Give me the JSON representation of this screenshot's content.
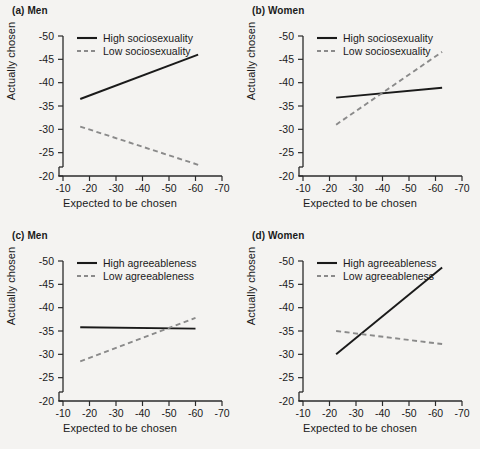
{
  "figure": {
    "background_color": "#f4f3f1",
    "solid_color": "#1a1a1a",
    "dashed_color": "#8a8a8a",
    "axis_color": "#2b2b2b"
  },
  "chart_data": [
    {
      "type": "line",
      "panel_id": "a",
      "title": "(a) Men",
      "xlabel": "Expected to be chosen",
      "ylabel": "Actually chosen",
      "xticks": [
        -10,
        -20,
        -30,
        -40,
        -50,
        -60,
        -70
      ],
      "yticks": [
        -50,
        -45,
        -40,
        -35,
        -30,
        -25,
        -20
      ],
      "xlim": [
        -10,
        -70
      ],
      "ylim": [
        -20,
        -50
      ],
      "x_inverted": true,
      "y_inverted": true,
      "grid": false,
      "legend_position": "top-left-inside",
      "series": [
        {
          "name": "High sociosexuality",
          "style": "solid",
          "x": [
            -16.5,
            -61.0
          ],
          "y": [
            -36.5,
            -46.0
          ]
        },
        {
          "name": "Low sociosexuality",
          "style": "dashed",
          "x": [
            -16.5,
            -61.0
          ],
          "y": [
            -30.6,
            -22.4
          ]
        }
      ]
    },
    {
      "type": "line",
      "panel_id": "b",
      "title": "(b) Women",
      "xlabel": "Expected to be chosen",
      "ylabel": "Actually chosen",
      "xticks": [
        -10,
        -20,
        -30,
        -40,
        -50,
        -60,
        -70
      ],
      "yticks": [
        -50,
        -45,
        -40,
        -35,
        -30,
        -25,
        -20
      ],
      "xlim": [
        -10,
        -70
      ],
      "ylim": [
        -20,
        -50
      ],
      "x_inverted": true,
      "y_inverted": true,
      "grid": false,
      "legend_position": "top-left-inside",
      "series": [
        {
          "name": "High sociosexuality",
          "style": "solid",
          "x": [
            -22.5,
            -62.5
          ],
          "y": [
            -36.8,
            -38.9
          ]
        },
        {
          "name": "Low sociosexuality",
          "style": "dashed",
          "x": [
            -22.5,
            -62.5
          ],
          "y": [
            -31.0,
            -46.6
          ]
        }
      ]
    },
    {
      "type": "line",
      "panel_id": "c",
      "title": "(c) Men",
      "xlabel": "Expected to be chosen",
      "ylabel": "Actually chosen",
      "xticks": [
        -10,
        -20,
        -30,
        -40,
        -50,
        -60,
        -70
      ],
      "yticks": [
        -50,
        -45,
        -40,
        -35,
        -30,
        -25,
        -20
      ],
      "xlim": [
        -10,
        -70
      ],
      "ylim": [
        -20,
        -50
      ],
      "x_inverted": true,
      "y_inverted": true,
      "grid": false,
      "legend_position": "top-left-inside",
      "series": [
        {
          "name": "High agreeableness",
          "style": "solid",
          "x": [
            -16.5,
            -60.0
          ],
          "y": [
            -35.8,
            -35.5
          ]
        },
        {
          "name": "Low agreeableness",
          "style": "dashed",
          "x": [
            -16.5,
            -60.0
          ],
          "y": [
            -28.5,
            -37.8
          ]
        }
      ]
    },
    {
      "type": "line",
      "panel_id": "d",
      "title": "(d) Women",
      "xlabel": "Expected to be chosen",
      "ylabel": "Actually chosen",
      "xticks": [
        -10,
        -20,
        -30,
        -40,
        -50,
        -60,
        -70
      ],
      "yticks": [
        -50,
        -45,
        -40,
        -35,
        -30,
        -25,
        -20
      ],
      "xlim": [
        -10,
        -70
      ],
      "ylim": [
        -20,
        -50
      ],
      "x_inverted": true,
      "y_inverted": true,
      "grid": false,
      "legend_position": "top-left-inside",
      "series": [
        {
          "name": "High agreeableness",
          "style": "solid",
          "x": [
            -22.5,
            -62.5
          ],
          "y": [
            -30.0,
            -48.6
          ]
        },
        {
          "name": "Low agreeableness",
          "style": "dashed",
          "x": [
            -22.5,
            -62.5
          ],
          "y": [
            -35.0,
            -32.2
          ]
        }
      ]
    }
  ]
}
